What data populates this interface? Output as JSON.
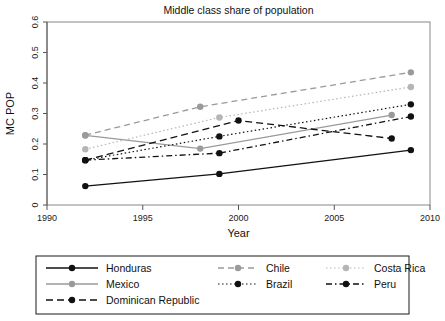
{
  "chart_data": {
    "type": "line",
    "title": "Middle class share of population",
    "xlabel": "Year",
    "ylabel": "MC POP",
    "xlim": [
      1990,
      2010
    ],
    "ylim": [
      0,
      0.6
    ],
    "xticks": [
      1990,
      1995,
      2000,
      2005,
      2010
    ],
    "xtick_labels": [
      "1990",
      "1995",
      "2000",
      "2005",
      "2010"
    ],
    "yticks": [
      0,
      0.1,
      0.2,
      0.3,
      0.4,
      0.5,
      0.6
    ],
    "ytick_labels": [
      "0",
      "0.1",
      "0.2",
      "0.3",
      "0.4",
      "0.5",
      "0.6"
    ],
    "grid": false,
    "legend_position": "bottom",
    "series": [
      {
        "name": "Honduras",
        "color": "#111111",
        "style": "solid",
        "dash": "none",
        "x": [
          1992,
          1999,
          2009
        ],
        "values": [
          0.062,
          0.102,
          0.18
        ]
      },
      {
        "name": "Mexico",
        "color": "#9a9a9a",
        "style": "solid",
        "dash": "none",
        "x": [
          1992,
          1998,
          2008
        ],
        "values": [
          0.228,
          0.185,
          0.295
        ]
      },
      {
        "name": "Dominican Republic",
        "color": "#111111",
        "style": "dashed",
        "dash": "7,4",
        "x": [
          1992,
          2000,
          2008
        ],
        "values": [
          0.147,
          0.277,
          0.218
        ]
      },
      {
        "name": "Chile",
        "color": "#9a9a9a",
        "style": "dashed",
        "dash": "6,4",
        "x": [
          1992,
          1998,
          2009
        ],
        "values": [
          0.229,
          0.322,
          0.435
        ]
      },
      {
        "name": "Brazil",
        "color": "#111111",
        "style": "dotted",
        "dash": "1.5,2.5",
        "x": [
          1992,
          1999,
          2009
        ],
        "values": [
          0.147,
          0.225,
          0.33
        ]
      },
      {
        "name": "Costa Rica",
        "color": "#b5b5b5",
        "style": "dotted",
        "dash": "1.5,2.5",
        "x": [
          1992,
          1999,
          2009
        ],
        "values": [
          0.183,
          0.287,
          0.387
        ]
      },
      {
        "name": "Peru",
        "color": "#111111",
        "style": "dashdot",
        "dash": "6,3,1.5,3",
        "x": [
          1992,
          1999,
          2009
        ],
        "values": [
          0.147,
          0.17,
          0.29
        ]
      }
    ]
  },
  "legend": {
    "columns": [
      [
        "Honduras",
        "Mexico",
        "Dominican Republic"
      ],
      [
        "Chile",
        "Brazil"
      ],
      [
        "Costa Rica",
        "Peru"
      ]
    ]
  }
}
